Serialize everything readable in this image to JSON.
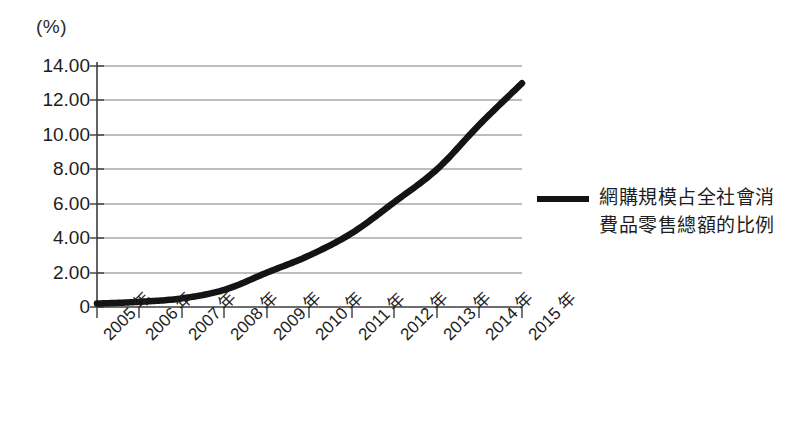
{
  "chart_data": {
    "type": "line",
    "title": "",
    "xlabel": "",
    "ylabel": "(%)",
    "unit_label": "(%)",
    "categories": [
      "2005 年",
      "2006 年",
      "2007 年",
      "2008 年",
      "2009 年",
      "2010 年",
      "2011 年",
      "2012 年",
      "2013 年",
      "2014 年",
      "2015 年"
    ],
    "x": [
      2005,
      2006,
      2007,
      2008,
      2009,
      2010,
      2011,
      2012,
      2013,
      2014,
      2015
    ],
    "series": [
      {
        "name": "網購規模占全社會消費品零售總額的比例",
        "values": [
          0.2,
          0.3,
          0.5,
          1.0,
          2.0,
          3.0,
          4.3,
          6.1,
          8.0,
          10.6,
          13.0
        ],
        "color": "#141414"
      }
    ],
    "ylim": [
      0,
      14
    ],
    "ytick_labels": [
      "0",
      "2.00",
      "4.00",
      "6.00",
      "8.00",
      "10.00",
      "12.00",
      "14.00"
    ],
    "ytick_values": [
      0,
      2,
      4,
      6,
      8,
      10,
      12,
      14
    ],
    "grid": true,
    "grid_color": "#808080",
    "legend_position": "right",
    "legend": [
      {
        "label_line1": "網購規模占全社會消",
        "label_line2": "費品零售總額的比例",
        "color": "#141414"
      }
    ]
  },
  "axis": {
    "unit": "(%)",
    "line_color": "#444444"
  }
}
